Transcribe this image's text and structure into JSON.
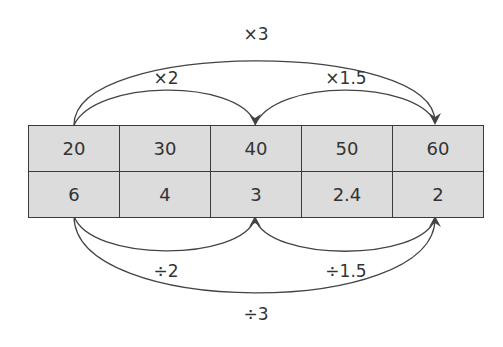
{
  "colors": {
    "cell_fill": "#dcdcdc",
    "line": "#444444",
    "text": "#333333"
  },
  "table": {
    "rows": [
      [
        "20",
        "30",
        "40",
        "50",
        "60"
      ],
      [
        "6",
        "4",
        "3",
        "2.4",
        "2"
      ]
    ]
  },
  "top_arrows": {
    "times2": "×2",
    "times1_5": "×1.5",
    "times3": "×3"
  },
  "bottom_arrows": {
    "div2": "÷2",
    "div1_5": "÷1.5",
    "div3": "÷3"
  }
}
